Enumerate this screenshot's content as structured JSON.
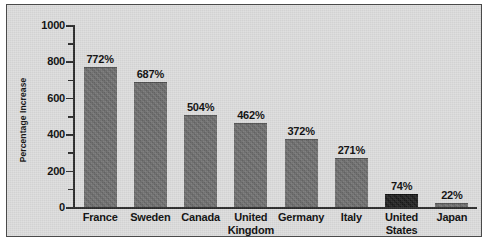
{
  "chart_data": {
    "type": "bar",
    "title": "",
    "subtitle": "",
    "xlabel": "",
    "ylabel": "Percentage Increase",
    "categories": [
      "France",
      "Sweden",
      "Canada",
      "United Kingdom",
      "Germany",
      "Italy",
      "United States",
      "Japan"
    ],
    "category_lines": [
      [
        "France"
      ],
      [
        "Sweden"
      ],
      [
        "Canada"
      ],
      [
        "United",
        "Kingdom"
      ],
      [
        "Germany"
      ],
      [
        "Italy"
      ],
      [
        "United",
        "States"
      ],
      [
        "Japan"
      ]
    ],
    "values": [
      772,
      687,
      504,
      462,
      372,
      271,
      74,
      22
    ],
    "value_labels": [
      "772%",
      "687%",
      "504%",
      "462%",
      "372%",
      "271%",
      "74%",
      "22%"
    ],
    "ylim": [
      0,
      1000
    ],
    "ytick_major": [
      0,
      200,
      400,
      600,
      800,
      1000
    ],
    "ytick_major_labels": [
      "0",
      "200",
      "400",
      "600",
      "800",
      "1000"
    ],
    "ytick_minor": [
      100,
      300,
      500,
      700,
      900
    ],
    "grid": false,
    "legend": null,
    "bar_colors": [
      "#6f6f6f",
      "#6f6f6f",
      "#6f6f6f",
      "#6f6f6f",
      "#6f6f6f",
      "#6f6f6f",
      "#1d1d1d",
      "#6f6f6f"
    ],
    "plot_background": "#dedede",
    "axis_color": "#2b2b2b",
    "text_color": "#0d0d0d"
  }
}
